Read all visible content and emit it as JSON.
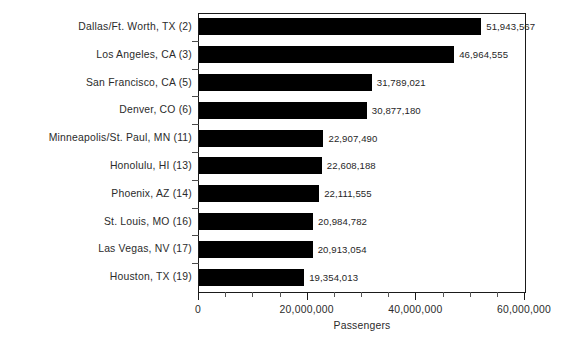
{
  "chart_data": {
    "type": "bar",
    "orientation": "horizontal",
    "title": "",
    "xlabel": "Passengers",
    "ylabel": "",
    "xlim": [
      0,
      60000000
    ],
    "grid": false,
    "legend": null,
    "xticks": [
      {
        "value": 0,
        "label": "0"
      },
      {
        "value": 20000000,
        "label": "20,000,000"
      },
      {
        "value": 40000000,
        "label": "40,000,000"
      },
      {
        "value": 60000000,
        "label": "60,000,000"
      }
    ],
    "minor_tick_step": 5000000,
    "bar_color": "#000000",
    "categories": [
      "Dallas/Ft. Worth, TX (2)",
      "Los Angeles, CA (3)",
      "San Francisco, CA (5)",
      "Denver, CO (6)",
      "Minneapolis/St. Paul, MN (11)",
      "Honolulu, HI (13)",
      "Phoenix, AZ (14)",
      "St. Louis, MO (16)",
      "Las Vegas, NV (17)",
      "Houston, TX (19)"
    ],
    "values": [
      51943567,
      46964555,
      31789021,
      30877180,
      22907490,
      22608188,
      22111555,
      20984782,
      20913054,
      19354013
    ],
    "value_labels": [
      "51,943,567",
      "46,964,555",
      "31,789,021",
      "30,877,180",
      "22,907,490",
      "22,608,188",
      "22,111,555",
      "20,984,782",
      "20,913,054",
      "19,354,013"
    ]
  }
}
